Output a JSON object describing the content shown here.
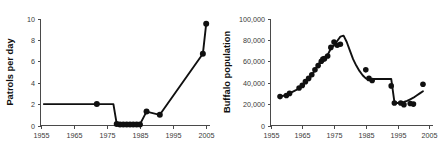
{
  "figure": {
    "background_color": "#ffffff",
    "ink_color": "#101010",
    "axis_color": "#4a4a4a"
  },
  "chart_data": [
    {
      "id": "patrols-chart",
      "type": "line",
      "title": "",
      "xlabel": "",
      "ylabel": "Patrols per day",
      "xlim": [
        1955,
        2006
      ],
      "ylim": [
        0,
        10
      ],
      "grid": false,
      "legend": "none",
      "xticks": [
        1955,
        1965,
        1975,
        1985,
        1995,
        2005
      ],
      "xticklabels": [
        "1955",
        "1965",
        "1975",
        "1985",
        "1995",
        "2005"
      ],
      "yticks": [
        0,
        2,
        4,
        6,
        8,
        10
      ],
      "yticklabels": [
        "0",
        "2",
        "4",
        "6",
        "8",
        "10"
      ],
      "line": {
        "x": [
          1956,
          1972,
          1977,
          1978,
          1979,
          1980,
          1981,
          1982,
          1983,
          1984,
          1985,
          1987,
          1991,
          2004,
          2005
        ],
        "y": [
          2.0,
          2.0,
          2.0,
          0.15,
          0.1,
          0.1,
          0.1,
          0.1,
          0.1,
          0.1,
          0.1,
          1.3,
          1.0,
          6.7,
          9.5
        ]
      },
      "markers": {
        "x": [
          1972,
          1978,
          1979,
          1980,
          1981,
          1982,
          1983,
          1984,
          1985,
          1987,
          1991,
          2004,
          2005
        ],
        "y": [
          2.0,
          0.15,
          0.1,
          0.1,
          0.1,
          0.1,
          0.1,
          0.1,
          0.1,
          1.3,
          1.0,
          6.7,
          9.5
        ]
      }
    },
    {
      "id": "buffalo-chart",
      "type": "line",
      "title": "",
      "xlabel": "",
      "ylabel": "Buffalo population",
      "xlim": [
        1955,
        2006
      ],
      "ylim": [
        0,
        100000
      ],
      "grid": false,
      "legend": "none",
      "xticks": [
        1955,
        1965,
        1975,
        1985,
        1995,
        2005
      ],
      "xticklabels": [
        "1955",
        "1965",
        "1975",
        "1985",
        "1995",
        "2005"
      ],
      "yticks": [
        0,
        20000,
        40000,
        60000,
        80000,
        100000
      ],
      "yticklabels": [
        "0",
        "20,000",
        "40,000",
        "60,000",
        "80,000",
        "100,000"
      ],
      "line": {
        "x": [
          1958,
          1960,
          1961,
          1963,
          1965,
          1966,
          1967,
          1968,
          1969,
          1970,
          1971,
          1972,
          1973,
          1974,
          1975,
          1976,
          1977,
          1978,
          1979,
          1980,
          1981,
          1982,
          1983,
          1984,
          1985,
          1986,
          1987,
          1988,
          1989,
          1990,
          1991,
          1992,
          1993,
          1994,
          1995,
          1996,
          1997,
          1998,
          1999,
          2000,
          2001,
          2002,
          2003
        ],
        "y": [
          27000,
          28500,
          30000,
          33000,
          37000,
          40000,
          43000,
          47000,
          52000,
          57000,
          61000,
          62000,
          66000,
          72000,
          75000,
          79000,
          83000,
          84000,
          78000,
          70000,
          62000,
          56000,
          51000,
          47000,
          44000,
          43000,
          43500,
          43500,
          43500,
          43500,
          43500,
          43500,
          43500,
          22000,
          21000,
          21500,
          22000,
          23000,
          24500,
          26000,
          28000,
          30000,
          32000
        ]
      },
      "markers": {
        "x": [
          1958,
          1960,
          1961,
          1964,
          1965,
          1966,
          1967,
          1968,
          1969,
          1970,
          1971,
          1971.5,
          1972,
          1973,
          1974,
          1975,
          1976,
          1977,
          1985,
          1986,
          1987,
          1993,
          1994,
          1996,
          1997,
          1999,
          2000,
          2003
        ],
        "y": [
          27000,
          28000,
          30000,
          35000,
          37500,
          41000,
          44000,
          47500,
          52000,
          56000,
          60000,
          62000,
          62500,
          65000,
          73000,
          78000,
          75000,
          76000,
          52000,
          44000,
          42000,
          37000,
          21000,
          21000,
          19500,
          20500,
          20000,
          38500
        ]
      }
    }
  ]
}
